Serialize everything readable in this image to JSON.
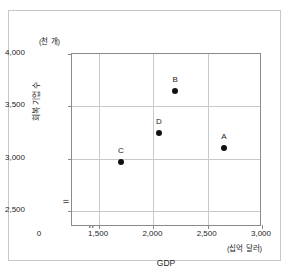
{
  "chart_data": {
    "type": "scatter",
    "title": "",
    "xlabel": "GDP",
    "ylabel": "회복 기업 수",
    "x_unit": "(십억 달러)",
    "y_unit": "(천 개)",
    "xlim": [
      1250,
      3000
    ],
    "ylim": [
      2350,
      4000
    ],
    "x_ticks": [
      "0",
      "1,500",
      "2,000",
      "2,500",
      "3,000"
    ],
    "x_tick_values": [
      0,
      1500,
      2000,
      2500,
      3000
    ],
    "y_ticks": [
      "2,500",
      "3,000",
      "3,500",
      "4,000"
    ],
    "y_tick_values": [
      2500,
      3000,
      3500,
      4000
    ],
    "grid": true,
    "legend": "none",
    "axis_break_x": true,
    "axis_break_y": true,
    "break_glyph_x": "//",
    "break_glyph_y": "≈",
    "points": [
      {
        "label": "A",
        "x": 2650,
        "y": 3100
      },
      {
        "label": "B",
        "x": 2200,
        "y": 3650
      },
      {
        "label": "C",
        "x": 1700,
        "y": 2975
      },
      {
        "label": "D",
        "x": 2050,
        "y": 3250
      }
    ]
  }
}
